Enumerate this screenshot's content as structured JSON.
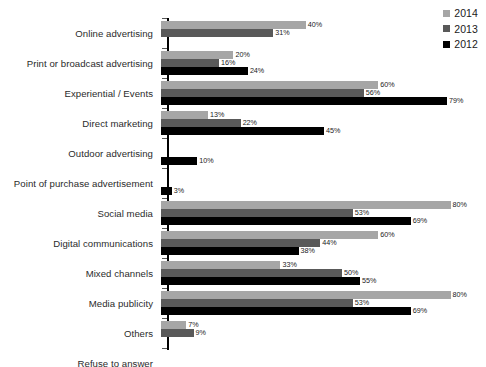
{
  "chart_data": {
    "type": "bar",
    "orientation": "horizontal",
    "title": "",
    "subtitle": "",
    "xlabel": "",
    "ylabel": "",
    "xlim": [
      0,
      85
    ],
    "grid": false,
    "legend_position": "top-right",
    "value_suffix": "%",
    "categories": [
      "Online advertising",
      "Print or broadcast advertising",
      "Experiential / Events",
      "Direct marketing",
      "Outdoor advertising",
      "Point of purchase advertisement",
      "Social media",
      "Digital communications",
      "Mixed channels",
      "Media publicity",
      "Others",
      "Refuse to answer"
    ],
    "series": [
      {
        "name": "2014",
        "color": "#a6a6a6",
        "values": [
          40,
          20,
          60,
          13,
          null,
          null,
          80,
          60,
          33,
          80,
          7,
          null
        ],
        "labels": [
          "40%",
          "20%",
          "60%",
          "13%",
          "",
          "",
          "80%",
          "60%",
          "33%",
          "80%",
          "7%",
          ""
        ]
      },
      {
        "name": "2013",
        "color": "#595959",
        "values": [
          31,
          16,
          56,
          22,
          null,
          null,
          53,
          44,
          50,
          53,
          9,
          null
        ],
        "labels": [
          "31%",
          "16%",
          "56%",
          "22%",
          "",
          "",
          "53%",
          "44%",
          "50%",
          "53%",
          "9%",
          ""
        ]
      },
      {
        "name": "2012",
        "color": "#000000",
        "values": [
          null,
          24,
          79,
          45,
          10,
          3,
          69,
          38,
          55,
          69,
          null,
          10
        ],
        "labels": [
          "",
          "24%",
          "79%",
          "45%",
          "10%",
          "3%",
          "69%",
          "38%",
          "55%",
          "69%",
          "",
          "10%"
        ]
      }
    ]
  },
  "legend": {
    "items": [
      {
        "label": "2014",
        "color": "#a6a6a6"
      },
      {
        "label": "2013",
        "color": "#595959"
      },
      {
        "label": "2012",
        "color": "#000000"
      }
    ]
  },
  "colors": {
    "background": "#ffffff",
    "axis": "#000000",
    "label_text": "#2b2b2b",
    "value_text": "#1a1a1a"
  }
}
